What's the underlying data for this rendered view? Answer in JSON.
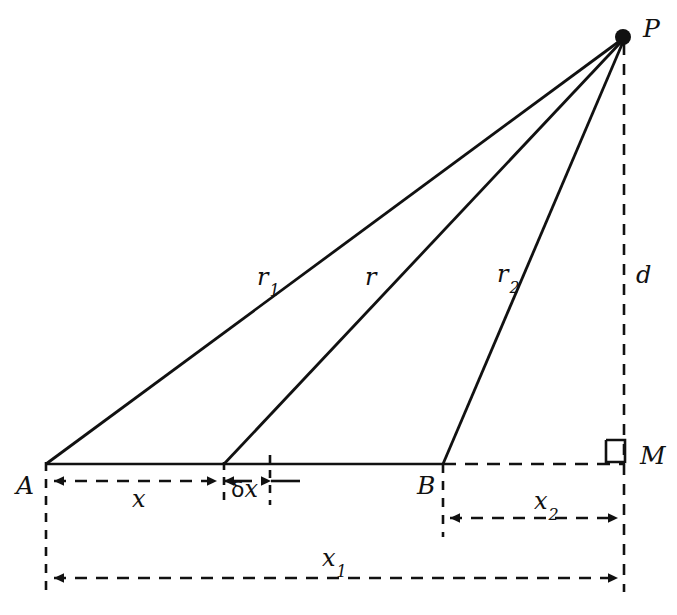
{
  "figure": {
    "type": "geometry-diagram",
    "background_color": "#ffffff",
    "stroke_color": "#111111"
  },
  "points": {
    "A": {
      "label": "A",
      "x": 46,
      "y": 464,
      "label_x": 16,
      "label_y": 473
    },
    "B": {
      "label": "B",
      "x": 443,
      "y": 464,
      "label_x": 417,
      "label_y": 473
    },
    "M": {
      "label": "M",
      "x": 625,
      "y": 464,
      "label_x": 640,
      "label_y": 443
    },
    "P": {
      "label": "P",
      "x": 623,
      "y": 37,
      "label_x": 643,
      "label_y": 16
    },
    "Q": {
      "label": "",
      "x": 224,
      "y": 464
    },
    "Q2": {
      "label": "",
      "x": 270,
      "y": 464
    }
  },
  "segments": {
    "r1": {
      "label": "r",
      "subscript": "1",
      "label_x": 257,
      "label_y": 265,
      "from": "A",
      "to": "P"
    },
    "r": {
      "label": "r",
      "subscript": "",
      "label_x": 365,
      "label_y": 265,
      "from": "Q",
      "to": "P"
    },
    "r2": {
      "label": "r",
      "subscript": "2",
      "label_x": 497,
      "label_y": 262,
      "from": "B",
      "to": "P"
    },
    "d": {
      "label": "d",
      "subscript": "",
      "label_x": 636,
      "label_y": 263,
      "from": "M",
      "to": "P"
    }
  },
  "dimensions": {
    "x": {
      "label": "x",
      "subscript": "",
      "prefix": "",
      "label_x": 132,
      "label_y": 487,
      "from_x": 46,
      "to_x": 224,
      "y": 481
    },
    "deltax": {
      "label": "x",
      "subscript": "",
      "prefix": "δ",
      "label_x": 231,
      "label_y": 477,
      "from_x": 224,
      "to_x": 270,
      "y": 481
    },
    "x2": {
      "label": "x",
      "subscript": "2",
      "prefix": "",
      "label_x": 534,
      "label_y": 489,
      "from_x": 443,
      "to_x": 625,
      "y": 518
    },
    "x1": {
      "label": "x",
      "subscript": "1",
      "prefix": "",
      "label_x": 322,
      "label_y": 546,
      "from_x": 46,
      "to_x": 625,
      "y": 578
    }
  },
  "marks": {
    "right_angle_at_M": {
      "name": "right-angle-mark",
      "x": 606,
      "y": 440,
      "size": 19
    }
  }
}
